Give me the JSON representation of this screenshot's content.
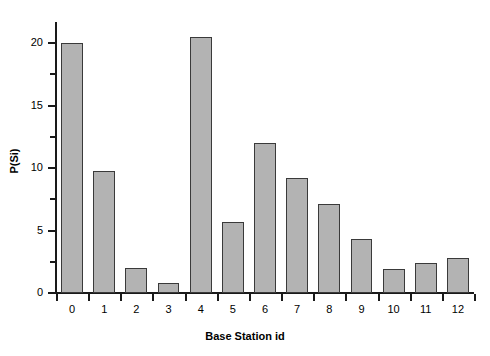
{
  "chart_data": {
    "type": "bar",
    "title": "",
    "xlabel": "Base Station id",
    "ylabel": "P(Si)",
    "categories": [
      "0",
      "1",
      "2",
      "3",
      "4",
      "5",
      "6",
      "7",
      "8",
      "9",
      "10",
      "11",
      "12"
    ],
    "values": [
      20.0,
      9.8,
      2.0,
      0.8,
      20.5,
      5.7,
      12.0,
      9.2,
      7.1,
      4.3,
      1.9,
      2.4,
      2.8
    ],
    "ylim": [
      0,
      22
    ],
    "yticks_major": [
      0,
      5,
      10,
      15,
      20
    ],
    "yticks_major_labels": [
      "0",
      "5",
      "10",
      "15",
      "20"
    ],
    "yticks_minor": [
      2.5,
      7.5,
      12.5,
      17.5
    ],
    "grid": false,
    "legend": null,
    "bar_fill_color": "#b3b3b3",
    "bar_edge_color": "#3a3a3a",
    "axis_color": "#1a1a1a",
    "background_color": "#ffffff"
  }
}
